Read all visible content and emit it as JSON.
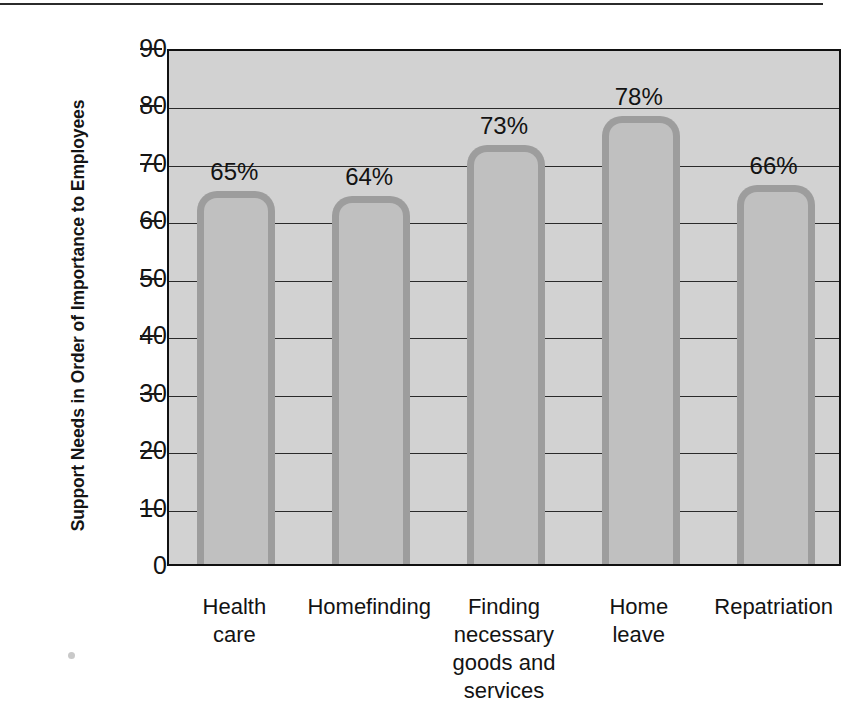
{
  "chart_data": {
    "type": "bar",
    "title": "",
    "subtitle": "",
    "xlabel": "",
    "ylabel": "Support Needs in Order of Importance to Employees",
    "categories": [
      "Health care",
      "Homefinding",
      "Finding necessary goods and services",
      "Home leave",
      "Repatriation"
    ],
    "category_lines": [
      [
        "Health",
        "care"
      ],
      [
        "Homefinding"
      ],
      [
        "Finding necessary",
        "goods and",
        "services"
      ],
      [
        "Home",
        "leave"
      ],
      [
        "Repatriation"
      ]
    ],
    "values": [
      65,
      64,
      73,
      78,
      66
    ],
    "data_labels": [
      "65%",
      "64%",
      "73%",
      "78%",
      "66%"
    ],
    "ylim": [
      0,
      90
    ],
    "ytick_values": [
      0,
      10,
      20,
      30,
      40,
      50,
      60,
      70,
      80,
      90
    ],
    "ytick_labels": [
      "0",
      "10",
      "20",
      "30",
      "40",
      "50",
      "60",
      "70",
      "80",
      "90"
    ],
    "grid": true,
    "legend": false,
    "legend_position": "none",
    "colors": {
      "plot_background": "#d2d2d2",
      "page_background": "#ffffff",
      "bar_fill": "#c0c0c0",
      "bar_border": "#9d9d9d",
      "axis": "#111111",
      "gridline": "#2a2a2a",
      "text": "#131313"
    }
  }
}
